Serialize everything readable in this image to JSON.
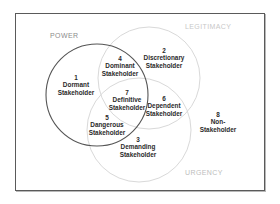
{
  "diagram": {
    "type": "venn",
    "sets": [
      {
        "id": "power",
        "label": "POWER",
        "stroke": "#555555"
      },
      {
        "id": "legitimacy",
        "label": "LEGITIMACY",
        "stroke": "#d8d8d8"
      },
      {
        "id": "urgency",
        "label": "URGENCY",
        "stroke": "#d8d8d8"
      }
    ],
    "regions": [
      {
        "number": "1",
        "line1": "Dormant",
        "line2": "Stakeholder",
        "sets": [
          "power"
        ]
      },
      {
        "number": "2",
        "line1": "Discretionary",
        "line2": "Stakeholder",
        "sets": [
          "legitimacy"
        ]
      },
      {
        "number": "3",
        "line1": "Demanding",
        "line2": "Stakeholder",
        "sets": [
          "urgency"
        ]
      },
      {
        "number": "4",
        "line1": "Dominant",
        "line2": "Stakeholder",
        "sets": [
          "power",
          "legitimacy"
        ]
      },
      {
        "number": "5",
        "line1": "Dangerous",
        "line2": "Stakeholder",
        "sets": [
          "power",
          "urgency"
        ]
      },
      {
        "number": "6",
        "line1": "Dependent",
        "line2": "Stakeholder",
        "sets": [
          "legitimacy",
          "urgency"
        ]
      },
      {
        "number": "7",
        "line1": "Definitive",
        "line2": "Stakeholder",
        "sets": [
          "power",
          "legitimacy",
          "urgency"
        ]
      },
      {
        "number": "8",
        "line1": "Non-",
        "line2": "Stakeholder",
        "sets": []
      }
    ],
    "colors": {
      "power_circle": "#555555",
      "other_circles": "#d8d8d8",
      "frame": "#5a5a5a",
      "text": "#2a2a2a"
    }
  }
}
